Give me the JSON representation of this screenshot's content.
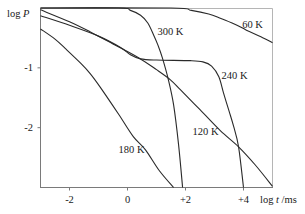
{
  "chart_data": {
    "type": "line",
    "title": "",
    "xlabel": {
      "prefix": "log ",
      "var": "t",
      "suffix": " /ms"
    },
    "ylabel": {
      "prefix": "log ",
      "var": "P"
    },
    "xlim": [
      -3,
      5
    ],
    "ylim": [
      -3,
      0
    ],
    "x_ticks": [
      {
        "value": -2,
        "label": "-2"
      },
      {
        "value": 0,
        "label": "0"
      },
      {
        "value": 2,
        "label": "+2"
      },
      {
        "value": 4,
        "label": "+4"
      }
    ],
    "y_ticks": [
      {
        "value": -1,
        "label": "-1"
      },
      {
        "value": -2,
        "label": "-2"
      }
    ],
    "grid": false,
    "legend": "inline curve labels",
    "series": [
      {
        "name": "60 K",
        "label_at": [
          4.31,
          -0.27
        ],
        "points": [
          [
            -3,
            0
          ],
          [
            1.5,
            0
          ],
          [
            2.2,
            -0.04
          ],
          [
            2.8,
            -0.1
          ],
          [
            3.2,
            -0.17
          ],
          [
            3.7,
            -0.27
          ],
          [
            4.1,
            -0.37
          ],
          [
            4.6,
            -0.48
          ],
          [
            5,
            -0.58
          ]
        ]
      },
      {
        "name": "300 K",
        "label_at": [
          1.48,
          -0.4
        ],
        "points": [
          [
            -3,
            0
          ],
          [
            -0.3,
            0
          ],
          [
            0.1,
            -0.04
          ],
          [
            0.45,
            -0.12
          ],
          [
            0.7,
            -0.25
          ],
          [
            0.9,
            -0.45
          ],
          [
            1.05,
            -0.62
          ],
          [
            1.2,
            -0.83
          ],
          [
            1.41,
            -1.2
          ],
          [
            1.59,
            -1.62
          ],
          [
            1.76,
            -2.28
          ],
          [
            1.9,
            -3
          ]
        ]
      },
      {
        "name": "240 K",
        "label_at": [
          3.69,
          -1.12
        ],
        "points": [
          [
            -3,
            -0.13
          ],
          [
            -2,
            -0.29
          ],
          [
            -1,
            -0.47
          ],
          [
            -0.24,
            -0.66
          ],
          [
            0.1,
            -0.78
          ],
          [
            0.45,
            -0.85
          ],
          [
            1,
            -0.87
          ],
          [
            2.17,
            -0.88
          ],
          [
            2.6,
            -0.9
          ],
          [
            2.9,
            -0.97
          ],
          [
            3.15,
            -1.15
          ],
          [
            3.31,
            -1.42
          ],
          [
            3.5,
            -1.72
          ],
          [
            3.66,
            -1.98
          ],
          [
            3.83,
            -2.32
          ],
          [
            4.0,
            -3
          ]
        ]
      },
      {
        "name": "120 K",
        "label_at": [
          2.69,
          -2.07
        ],
        "points": [
          [
            -3,
            -0.03
          ],
          [
            -2,
            -0.23
          ],
          [
            -1.28,
            -0.4
          ],
          [
            -0.5,
            -0.6
          ],
          [
            0.38,
            -0.83
          ],
          [
            1.0,
            -1.03
          ],
          [
            1.48,
            -1.2
          ],
          [
            1.83,
            -1.37
          ],
          [
            2.5,
            -1.7
          ],
          [
            3.2,
            -2.05
          ],
          [
            3.83,
            -2.32
          ],
          [
            4.4,
            -2.62
          ],
          [
            5,
            -2.98
          ]
        ]
      },
      {
        "name": "180 K",
        "label_at": [
          0.14,
          -2.37
        ],
        "points": [
          [
            -3,
            -0.35
          ],
          [
            -2.5,
            -0.52
          ],
          [
            -2.14,
            -0.68
          ],
          [
            -1.6,
            -0.93
          ],
          [
            -1.28,
            -1.1
          ],
          [
            -0.93,
            -1.33
          ],
          [
            -0.3,
            -1.78
          ],
          [
            0.2,
            -2.15
          ],
          [
            0.62,
            -2.37
          ],
          [
            1.1,
            -2.72
          ],
          [
            1.59,
            -3
          ]
        ]
      }
    ]
  }
}
